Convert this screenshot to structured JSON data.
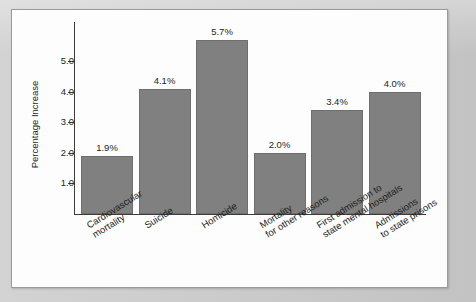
{
  "chart_data": {
    "type": "bar",
    "title": "",
    "subtitle": "",
    "xlabel": "",
    "ylabel": "Percentage Increase",
    "categories": [
      "Cardiovascular\nmortality",
      "Suicide",
      "Homicide",
      "Mortality\nfor other reasons",
      "First admission to\nstate mental hospitals",
      "Admissions\nto state prisons"
    ],
    "values": [
      1.9,
      4.1,
      5.7,
      2.0,
      3.4,
      4.0
    ],
    "data_labels": [
      "1.9%",
      "4.1%",
      "5.7%",
      "2.0%",
      "3.4%",
      "4.0%"
    ],
    "ylim": [
      0,
      6.0
    ],
    "ytick_values": [
      1.0,
      2.0,
      3.0,
      4.0,
      5.0
    ],
    "ytick_labels": [
      "1.0",
      "2.0",
      "3.0",
      "4.0",
      "5.0"
    ],
    "grid": false,
    "legend": null,
    "legend_position": "none",
    "bar_color": "#808080",
    "axis_color": "#3c3c3c",
    "text_color": "#1d1d1d",
    "background_color": "#fdfdfd",
    "page_color": "#c9c9c9"
  },
  "axis": {
    "y_title": "Percentage Increase"
  }
}
